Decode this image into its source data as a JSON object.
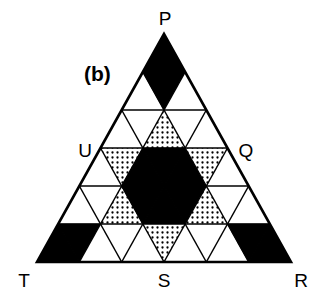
{
  "figure": {
    "panel_label": "(b)",
    "vertex_labels": {
      "top": "P",
      "right_mid": "Q",
      "bottom_right": "R",
      "bottom_mid": "S",
      "bottom_left": "T",
      "left_mid": "U"
    },
    "colors": {
      "line": "#000000",
      "solid": "#000000",
      "empty": "#ffffff",
      "dot": "#000000"
    },
    "grid": {
      "subdivisions": 6,
      "rows": [
        [
          "black"
        ],
        [
          "white",
          "black",
          "white"
        ],
        [
          "white",
          "white",
          "dotted",
          "white",
          "white"
        ],
        [
          "white",
          "dotted",
          "black",
          "black",
          "black",
          "dotted",
          "white"
        ],
        [
          "white",
          "white",
          "dotted",
          "black",
          "black",
          "black",
          "dotted",
          "white",
          "white"
        ],
        [
          "black",
          "black",
          "white",
          "white",
          "white",
          "dotted",
          "white",
          "white",
          "white",
          "black",
          "black"
        ]
      ]
    }
  }
}
